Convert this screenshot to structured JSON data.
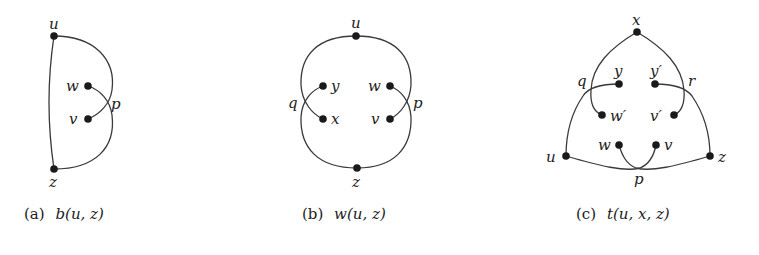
{
  "figures": [
    {
      "id": "a",
      "caption_prefix": "(a)",
      "caption_math": "b(u, z)",
      "nodes": {
        "u": "u",
        "z": "z",
        "w": "w",
        "v": "v"
      },
      "crossings": {
        "p": "p"
      }
    },
    {
      "id": "b",
      "caption_prefix": "(b)",
      "caption_math": "w(u, z)",
      "nodes": {
        "u": "u",
        "z": "z",
        "y": "y",
        "x": "x",
        "w": "w",
        "v": "v"
      },
      "crossings": {
        "q": "q",
        "p": "p"
      }
    },
    {
      "id": "c",
      "caption_prefix": "(c)",
      "caption_math": "t(u, x, z)",
      "nodes": {
        "x": "x",
        "y": "y",
        "y2": "y′",
        "w2": "w′",
        "v2": "v′",
        "w": "w",
        "v": "v",
        "u": "u",
        "z": "z"
      },
      "crossings": {
        "q": "q",
        "r": "r",
        "p": "p"
      }
    }
  ],
  "colors": {
    "stroke": "#3a3a3a",
    "node": "#1a1a1a",
    "text": "#222222",
    "background": "#ffffff"
  }
}
